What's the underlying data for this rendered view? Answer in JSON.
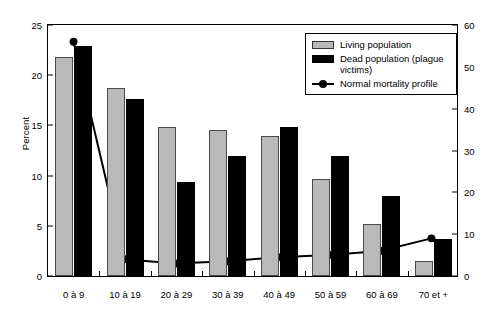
{
  "chart_data": {
    "type": "bar",
    "title": "",
    "xlabel": "",
    "ylabel": "Percent",
    "y2label": "",
    "categories": [
      "0 à 9",
      "10 à 19",
      "20 à 29",
      "30 à 39",
      "40 à 49",
      "50 à 59",
      "60 à 69",
      "70 et +"
    ],
    "ylim": [
      0,
      25
    ],
    "y2lim": [
      0,
      60
    ],
    "yticks": [
      0,
      5,
      10,
      15,
      20,
      25
    ],
    "y2ticks": [
      0,
      10,
      20,
      30,
      40,
      50,
      60
    ],
    "grid": false,
    "legend_position": "top-right",
    "series": [
      {
        "name": "Living population",
        "kind": "bar",
        "axis": "left",
        "color": "#b9b9b9",
        "values": [
          21.8,
          18.7,
          14.8,
          14.5,
          13.9,
          9.7,
          5.2,
          1.5
        ]
      },
      {
        "name": "Dead population (plague victims)",
        "kind": "bar",
        "axis": "left",
        "color": "#000000",
        "values": [
          22.9,
          17.6,
          9.4,
          12.0,
          14.8,
          12.0,
          8.0,
          3.7
        ]
      },
      {
        "name": "Normal mortality profile",
        "kind": "line",
        "axis": "right",
        "color": "#000000",
        "values": [
          56.0,
          4.0,
          3.0,
          3.5,
          4.5,
          5.0,
          6.0,
          9.0
        ]
      }
    ]
  },
  "legend": {
    "items": [
      {
        "label": "Living population",
        "swatch": "living-swatch"
      },
      {
        "label": "Dead population (plague victims)",
        "swatch": "dead-swatch"
      },
      {
        "label": "Normal mortality profile",
        "swatch": "line-marker-swatch"
      }
    ]
  },
  "axes": {
    "left_title": "Percent",
    "left_ticks": [
      "0",
      "5",
      "10",
      "15",
      "20",
      "25"
    ],
    "right_ticks": [
      "0",
      "10",
      "20",
      "30",
      "40",
      "50",
      "60"
    ]
  }
}
